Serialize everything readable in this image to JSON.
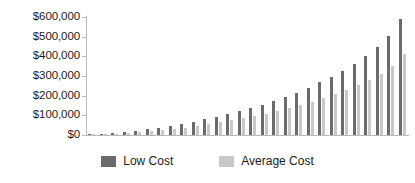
{
  "chart_data": {
    "type": "bar",
    "title": "",
    "subtitle": "",
    "xlabel": "",
    "ylabel": "",
    "grid": false,
    "legend_position": "bottom-center",
    "ylim": [
      0,
      600000
    ],
    "ytick_values": [
      0,
      100000,
      200000,
      300000,
      400000,
      500000,
      600000
    ],
    "ytick_labels": [
      "$0",
      "$100,000",
      "$200,000",
      "$300,000",
      "$400,000",
      "$500,000",
      "$600,000"
    ],
    "xtick_labels": [],
    "categories": [
      "1",
      "2",
      "3",
      "4",
      "5",
      "6",
      "7",
      "8",
      "9",
      "10",
      "11",
      "12",
      "13",
      "14",
      "15",
      "16",
      "17",
      "18",
      "19",
      "20",
      "21",
      "22",
      "23",
      "24",
      "25",
      "26",
      "27",
      "28"
    ],
    "series": [
      {
        "name": "Low Cost",
        "color": "#6b6b6b",
        "values": [
          4000,
          7000,
          11000,
          16000,
          22000,
          29000,
          37000,
          46000,
          56000,
          67000,
          79000,
          92000,
          106000,
          121000,
          137000,
          154000,
          172000,
          193000,
          216000,
          241000,
          268000,
          297000,
          328000,
          363000,
          403000,
          448000,
          505000,
          590000
        ]
      },
      {
        "name": "Average Cost",
        "color": "#c8c8c8",
        "values": [
          2000,
          4000,
          7000,
          10000,
          14000,
          19000,
          25000,
          31000,
          38000,
          46000,
          55000,
          64000,
          74000,
          85000,
          96000,
          108000,
          121000,
          135000,
          151000,
          168000,
          187000,
          207000,
          229000,
          253000,
          281000,
          312000,
          352000,
          410000
        ]
      }
    ]
  },
  "legend": {
    "items": [
      {
        "label": "Low Cost",
        "color": "#6b6b6b",
        "swatch_class": "low"
      },
      {
        "label": "Average Cost",
        "color": "#c8c8c8",
        "swatch_class": "avg"
      }
    ]
  },
  "colors": {
    "low_cost": "#6b6b6b",
    "average_cost": "#c8c8c8",
    "axis": "#b9b9b9",
    "text": "#1c1c1c",
    "background": "#ffffff"
  }
}
